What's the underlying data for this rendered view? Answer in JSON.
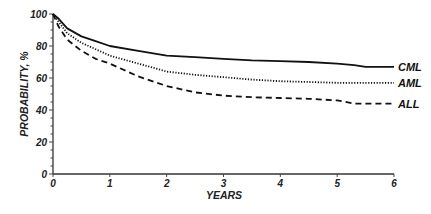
{
  "chart_data": {
    "type": "line",
    "title": "",
    "xlabel": "YEARS",
    "ylabel": "PROBABILITY, %",
    "xlim": [
      0,
      6
    ],
    "ylim": [
      0,
      100
    ],
    "grid": false,
    "legend_position": "inline-right",
    "x_ticks": [
      "0",
      "1",
      "2",
      "3",
      "4",
      "5",
      "6"
    ],
    "y_ticks": [
      "0",
      "20",
      "40",
      "60",
      "80",
      "100"
    ],
    "x": [
      0,
      0.1,
      0.25,
      0.5,
      0.75,
      1,
      1.5,
      2,
      2.5,
      3,
      3.5,
      4,
      4.5,
      5,
      5.3,
      5.5,
      6
    ],
    "series": [
      {
        "name": "CML",
        "style": "solid",
        "values": [
          100,
          97,
          91,
          86,
          83,
          80,
          77,
          74,
          73,
          72,
          71,
          70.5,
          70,
          69,
          68,
          67,
          67
        ]
      },
      {
        "name": "AML",
        "style": "dotted",
        "values": [
          100,
          95,
          88,
          82,
          78,
          74,
          69,
          64,
          62,
          60.5,
          59,
          58,
          57.5,
          57,
          57,
          57,
          57
        ]
      },
      {
        "name": "ALL",
        "style": "dashed",
        "values": [
          100,
          92,
          84,
          77,
          72,
          69,
          61,
          55,
          51,
          49,
          48,
          47.5,
          47,
          46,
          44,
          44,
          44
        ]
      }
    ]
  }
}
